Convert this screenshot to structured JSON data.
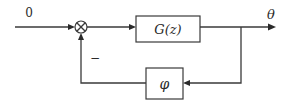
{
  "diagram": {
    "type": "feedback-control-block-diagram",
    "input": {
      "label": "0"
    },
    "summing_junction": {
      "symbol": "⊗",
      "feedback_sign": "−"
    },
    "forward_block": {
      "label": "G(z)"
    },
    "feedback_block": {
      "label": "φ"
    },
    "output": {
      "label": "θ"
    },
    "colors": {
      "stroke": "#3a3a3a",
      "text": "#2a2a2a",
      "background": "#ffffff"
    }
  }
}
